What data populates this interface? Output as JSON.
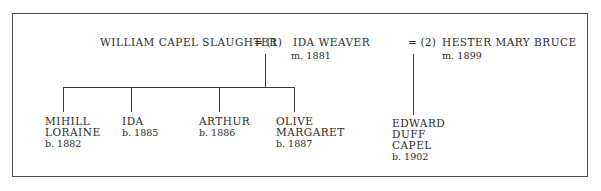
{
  "tree": {
    "father": {
      "name": "WILLIAM CAPEL SLAUGHTER"
    },
    "marriages": [
      {
        "marker": "= (1)",
        "spouse": "IDA WEAVER",
        "married": "m. 1881",
        "children": [
          {
            "name_lines": [
              "MIHILL",
              "LORAINE"
            ],
            "born": "b. 1882"
          },
          {
            "name_lines": [
              "IDA"
            ],
            "born": "b. 1885"
          },
          {
            "name_lines": [
              "ARTHUR"
            ],
            "born": "b. 1886"
          },
          {
            "name_lines": [
              "OLIVE",
              "MARGARET"
            ],
            "born": "b. 1887"
          }
        ]
      },
      {
        "marker": "= (2)",
        "spouse": "HESTER MARY BRUCE",
        "married": "m. 1899",
        "children": [
          {
            "name_lines": [
              "EDWARD",
              "DUFF",
              "CAPEL"
            ],
            "born": "b. 1902"
          }
        ]
      }
    ]
  },
  "colors": {
    "line": "#3a3a3a",
    "text": "#2a2a2a",
    "background": "#ffffff"
  }
}
